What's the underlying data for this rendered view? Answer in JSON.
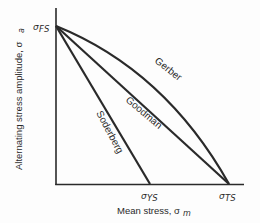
{
  "diagram": {
    "type": "fatigue-diagram",
    "axes": {
      "y_label": "Alternating stress amplitude, σ",
      "y_label_sub": "a",
      "x_label": "Mean stress, σ",
      "x_label_sub": "m"
    },
    "points": {
      "fs": {
        "label": "σ",
        "sub": "FS"
      },
      "ys": {
        "label": "σ",
        "sub": "YS"
      },
      "ts": {
        "label": "σ",
        "sub": "TS"
      }
    },
    "curves": [
      {
        "name": "Gerber",
        "shape": "parabola",
        "from": "σFS",
        "to": "σTS"
      },
      {
        "name": "Goodman",
        "shape": "line",
        "from": "σFS",
        "to": "σTS"
      },
      {
        "name": "Soderberg",
        "shape": "line",
        "from": "σFS",
        "to": "σYS"
      }
    ],
    "labels": {
      "gerber": "Gerber",
      "goodman": "Goodman",
      "soderberg": "Soderberg"
    },
    "colors": {
      "line": "#2a2a2a",
      "background": "#fdfdfd"
    }
  }
}
